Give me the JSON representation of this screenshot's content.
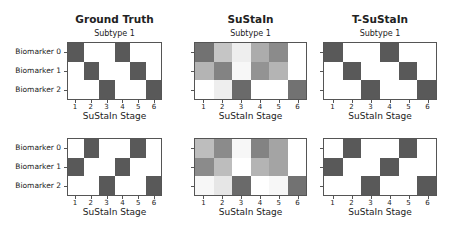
{
  "columns": [
    {
      "title": "Ground Truth",
      "left": 67,
      "width": 95
    },
    {
      "title": "SuStaIn",
      "left": 194,
      "width": 113
    },
    {
      "title": "T-SuStaIn",
      "left": 323,
      "width": 114
    }
  ],
  "rows": [
    {
      "subtitle": "Subtype 1",
      "top": 42,
      "height": 58
    },
    {
      "subtitle": "",
      "top": 138,
      "height": 58
    }
  ],
  "ylabels": [
    "Biomarker 0",
    "Biomarker 1",
    "Biomarker 2"
  ],
  "xticks": [
    "1",
    "2",
    "3",
    "4",
    "5",
    "6"
  ],
  "xlabel": "SuStaIn Stage",
  "colors": {
    "dark": "#595959",
    "light": "#ffffff",
    "axis": "#555555"
  },
  "chart_data": [
    {
      "type": "heatmap",
      "title": "Ground Truth",
      "subtitle": "Subtype 1",
      "xlabel": "SuStaIn Stage",
      "x": [
        1,
        2,
        3,
        4,
        5,
        6
      ],
      "y": [
        "Biomarker 0",
        "Biomarker 1",
        "Biomarker 2"
      ],
      "values": [
        [
          1,
          0,
          0,
          1,
          0,
          0
        ],
        [
          0,
          1,
          0,
          0,
          1,
          0
        ],
        [
          0,
          0,
          1,
          0,
          0,
          1
        ]
      ]
    },
    {
      "type": "heatmap",
      "title": "SuStaIn",
      "subtitle": "Subtype 1",
      "xlabel": "SuStaIn Stage",
      "x": [
        1,
        2,
        3,
        4,
        5,
        6
      ],
      "y": [
        "Biomarker 0",
        "Biomarker 1",
        "Biomarker 2"
      ],
      "values": [
        [
          0.85,
          0.35,
          0.1,
          0.5,
          0.7,
          0.0
        ],
        [
          0.45,
          0.75,
          0.05,
          0.65,
          0.45,
          0.0
        ],
        [
          0.0,
          0.1,
          0.9,
          0.0,
          0.0,
          0.85
        ]
      ]
    },
    {
      "type": "heatmap",
      "title": "T-SuStaIn",
      "subtitle": "Subtype 1",
      "xlabel": "SuStaIn Stage",
      "x": [
        1,
        2,
        3,
        4,
        5,
        6
      ],
      "y": [
        "Biomarker 0",
        "Biomarker 1",
        "Biomarker 2"
      ],
      "values": [
        [
          1,
          0,
          0,
          1,
          0,
          0
        ],
        [
          0,
          1,
          0,
          0,
          1,
          0
        ],
        [
          0,
          0,
          1,
          0,
          0,
          1
        ]
      ]
    },
    {
      "type": "heatmap",
      "title": "Ground Truth",
      "subtitle": "Subtype 2",
      "xlabel": "SuStaIn Stage",
      "x": [
        1,
        2,
        3,
        4,
        5,
        6
      ],
      "y": [
        "Biomarker 0",
        "Biomarker 1",
        "Biomarker 2"
      ],
      "values": [
        [
          0,
          1,
          0,
          0,
          1,
          0
        ],
        [
          1,
          0,
          0,
          1,
          0,
          0
        ],
        [
          0,
          0,
          1,
          0,
          0,
          1
        ]
      ]
    },
    {
      "type": "heatmap",
      "title": "SuStaIn",
      "subtitle": "Subtype 2",
      "xlabel": "SuStaIn Stage",
      "x": [
        1,
        2,
        3,
        4,
        5,
        6
      ],
      "y": [
        "Biomarker 0",
        "Biomarker 1",
        "Biomarker 2"
      ],
      "values": [
        [
          0.4,
          0.7,
          0.05,
          0.75,
          0.55,
          0.0
        ],
        [
          0.7,
          0.4,
          0.0,
          0.45,
          0.55,
          0.0
        ],
        [
          0.05,
          0.15,
          0.9,
          0.0,
          0.05,
          0.85
        ]
      ]
    },
    {
      "type": "heatmap",
      "title": "T-SuStaIn",
      "subtitle": "Subtype 2",
      "xlabel": "SuStaIn Stage",
      "x": [
        1,
        2,
        3,
        4,
        5,
        6
      ],
      "y": [
        "Biomarker 0",
        "Biomarker 1",
        "Biomarker 2"
      ],
      "values": [
        [
          0,
          1,
          0,
          0,
          1,
          0
        ],
        [
          1,
          0,
          0,
          1,
          0,
          0
        ],
        [
          0,
          0,
          1,
          0,
          0,
          1
        ]
      ]
    }
  ]
}
